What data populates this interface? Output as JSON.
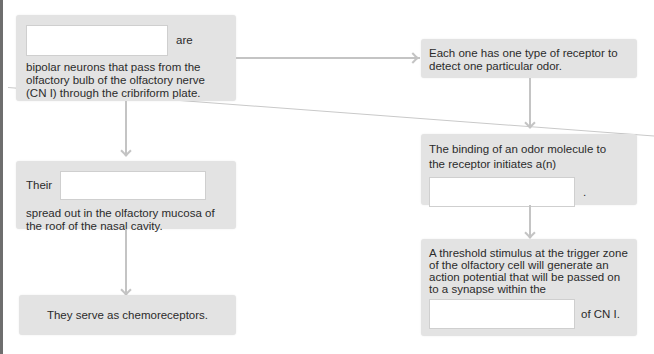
{
  "diagram": {
    "left_column": {
      "box1": {
        "blank_value": "",
        "after_blank": "are",
        "text": "bipolar neurons that pass from the olfactory bulb of the olfactory nerve (CN I) through the cribriform plate."
      },
      "box2": {
        "before_blank": "Their",
        "blank_value": "",
        "text": "spread out in the olfactory mucosa of the roof of the nasal cavity."
      },
      "box3": {
        "text": "They serve as chemoreceptors."
      }
    },
    "right_column": {
      "box1": {
        "text": "Each one has one type of receptor to detect one particular odor."
      },
      "box2": {
        "text": "The binding of an odor molecule to the receptor initiates a(n)",
        "blank_value": "",
        "after_blank": "."
      },
      "box3": {
        "text": "A threshold stimulus at the trigger zone of the olfactory cell will generate an action potential that will be passed on to a synapse within the",
        "blank_value": "",
        "after_blank": "of CN I."
      }
    },
    "colors": {
      "box_background": "#e3e3e3",
      "connector": "#c4c4c4",
      "blank_background": "#ffffff",
      "left_bar": "#6e6e6e"
    }
  }
}
